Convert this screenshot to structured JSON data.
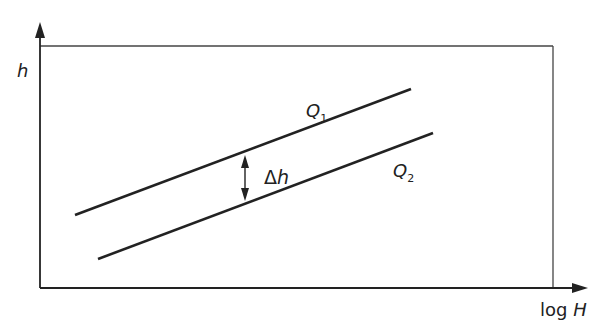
{
  "diagram": {
    "y_axis_label": "h",
    "x_axis_label_prefix": "log ",
    "x_axis_label_var": "H",
    "lines": [
      {
        "name": "Q",
        "subscript": "1",
        "x1": 75,
        "y1": 215,
        "x2": 411,
        "y2": 89
      },
      {
        "name": "Q",
        "subscript": "2",
        "x1": 98,
        "y1": 259,
        "x2": 433,
        "y2": 133
      }
    ],
    "delta_label_symbol": "Δ",
    "delta_label_var": "h",
    "colors": {
      "stroke": "#222222",
      "frame": "#444444",
      "background": "#ffffff"
    }
  }
}
